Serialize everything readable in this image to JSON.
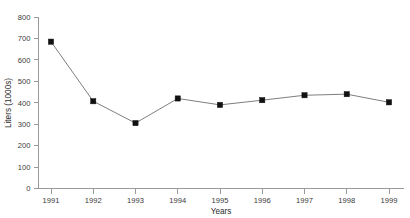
{
  "chart_data": {
    "type": "line",
    "title": "",
    "xlabel": "Years",
    "ylabel": "Liters (1000s)",
    "categories": [
      "1991",
      "1992",
      "1993",
      "1994",
      "1995",
      "1996",
      "1997",
      "1998",
      "1999"
    ],
    "values": [
      685,
      407,
      305,
      420,
      390,
      412,
      435,
      440,
      402
    ],
    "series": [
      {
        "name": "Liters",
        "values": [
          685,
          407,
          305,
          420,
          390,
          412,
          435,
          440,
          402
        ]
      }
    ],
    "ylim": [
      0,
      800
    ],
    "ytick_labels": [
      "0",
      "100",
      "200",
      "300",
      "400",
      "500",
      "600",
      "700",
      "800"
    ],
    "ytick_values": [
      0,
      100,
      200,
      300,
      400,
      500,
      600,
      700,
      800
    ],
    "xtick_labels": [
      "1991",
      "1992",
      "1993",
      "1994",
      "1995",
      "1996",
      "1997",
      "1998",
      "1999"
    ],
    "grid": false,
    "legend": false,
    "legend_position": "none",
    "marker": "square",
    "line_color": "#6f6f6f",
    "marker_color": "#111111",
    "axis_color": "#9a9a9a",
    "background_color": "#ffffff"
  }
}
